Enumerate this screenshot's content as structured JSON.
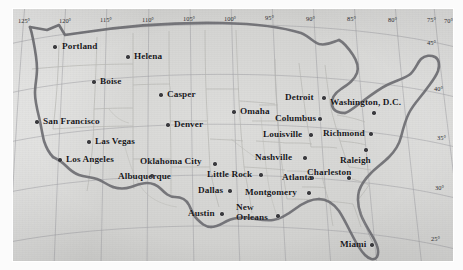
{
  "map": {
    "title": "Map of the contiguous United States with major cities",
    "projection_note": "conic, graticule at 5 degree intervals",
    "colors": {
      "land": "#d6d6d4",
      "paper": "#fbfbfb",
      "coastline": "#6d6d72",
      "state_border": "#b6b6b3",
      "grid_line": "#8f8f94",
      "city_dot": "#3a3a3e",
      "label_text": "#17171a"
    },
    "graticule": {
      "longitude_labels": [
        "125°",
        "120°",
        "115°",
        "110°",
        "105°",
        "100°",
        "95°",
        "90°",
        "85°",
        "80°",
        "75°",
        "70°",
        "65°"
      ],
      "latitude_labels": [
        "45°",
        "40°",
        "35°",
        "30°",
        "25°"
      ]
    },
    "cities": [
      {
        "name": "Portland",
        "label_x": 62,
        "label_y": 42,
        "dot_x": 55,
        "dot_y": 47,
        "anchor": "left"
      },
      {
        "name": "Helena",
        "label_x": 134,
        "label_y": 52,
        "dot_x": 128,
        "dot_y": 57,
        "anchor": "left"
      },
      {
        "name": "Boise",
        "label_x": 100,
        "label_y": 77,
        "dot_x": 94,
        "dot_y": 82,
        "anchor": "left"
      },
      {
        "name": "Casper",
        "label_x": 167,
        "label_y": 90,
        "dot_x": 161,
        "dot_y": 95,
        "anchor": "left"
      },
      {
        "name": "Detroit",
        "label_x": 285,
        "label_y": 93,
        "dot_x": 324,
        "dot_y": 98,
        "anchor": "left"
      },
      {
        "name": "Omaha",
        "label_x": 240,
        "label_y": 107,
        "dot_x": 234,
        "dot_y": 112,
        "anchor": "left"
      },
      {
        "name": "Washington, D.C.",
        "label_x": 330,
        "label_y": 98,
        "dot_x": 374,
        "dot_y": 113,
        "anchor": "left"
      },
      {
        "name": "San Francisco",
        "label_x": 43,
        "label_y": 117,
        "dot_x": 37,
        "dot_y": 122,
        "anchor": "left"
      },
      {
        "name": "Denver",
        "label_x": 174,
        "label_y": 120,
        "dot_x": 168,
        "dot_y": 125,
        "anchor": "left"
      },
      {
        "name": "Columbus",
        "label_x": 275,
        "label_y": 114,
        "dot_x": 320,
        "dot_y": 119,
        "anchor": "left"
      },
      {
        "name": "Louisville",
        "label_x": 263,
        "label_y": 130,
        "dot_x": 311,
        "dot_y": 135,
        "anchor": "left"
      },
      {
        "name": "Richmond",
        "label_x": 323,
        "label_y": 129,
        "dot_x": 371,
        "dot_y": 134,
        "anchor": "left"
      },
      {
        "name": "Las Vegas",
        "label_x": 95,
        "label_y": 137,
        "dot_x": 89,
        "dot_y": 142,
        "anchor": "left"
      },
      {
        "name": "Los Angeles",
        "label_x": 66,
        "label_y": 155,
        "dot_x": 60,
        "dot_y": 160,
        "anchor": "left"
      },
      {
        "name": "Oklahoma City",
        "label_x": 140,
        "label_y": 157,
        "dot_x": 215,
        "dot_y": 164,
        "anchor": "left"
      },
      {
        "name": "Nashville",
        "label_x": 255,
        "label_y": 153,
        "dot_x": 305,
        "dot_y": 158,
        "anchor": "left"
      },
      {
        "name": "Raleigh",
        "label_x": 340,
        "label_y": 156,
        "dot_x": 366,
        "dot_y": 150,
        "anchor": "left"
      },
      {
        "name": "Albuquerque",
        "label_x": 118,
        "label_y": 172,
        "dot_x": 152,
        "dot_y": 176,
        "anchor": "left"
      },
      {
        "name": "Little Rock",
        "label_x": 207,
        "label_y": 170,
        "dot_x": 261,
        "dot_y": 175,
        "anchor": "left"
      },
      {
        "name": "Charleston",
        "label_x": 307,
        "label_y": 168,
        "dot_x": 349,
        "dot_y": 178,
        "anchor": "left"
      },
      {
        "name": "Atlanta",
        "label_x": 282,
        "label_y": 173,
        "dot_x": 312,
        "dot_y": 178,
        "anchor": "left"
      },
      {
        "name": "Dallas",
        "label_x": 198,
        "label_y": 186,
        "dot_x": 230,
        "dot_y": 191,
        "anchor": "left"
      },
      {
        "name": "Montgomery",
        "label_x": 245,
        "label_y": 188,
        "dot_x": 309,
        "dot_y": 193,
        "anchor": "left"
      },
      {
        "name": "Austin",
        "label_x": 188,
        "label_y": 209,
        "dot_x": 222,
        "dot_y": 214,
        "anchor": "left"
      },
      {
        "name": "New Orleans",
        "label_x": 236,
        "label_y": 203,
        "dot_x": 278,
        "dot_y": 216,
        "anchor": "left",
        "two_line": true
      },
      {
        "name": "Miami",
        "label_x": 340,
        "label_y": 240,
        "dot_x": 372,
        "dot_y": 245,
        "anchor": "left"
      }
    ]
  }
}
